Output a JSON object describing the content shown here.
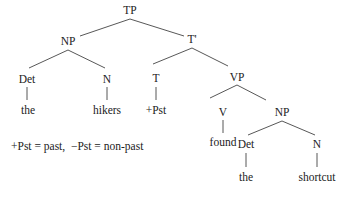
{
  "diagram": {
    "type": "syntax-tree",
    "nodes": {
      "tp": "TP",
      "np_subject": "NP",
      "det_subject": "Det",
      "n_subject": "N",
      "word_the_1": "the",
      "word_hikers": "hikers",
      "t_bar": "T'",
      "t": "T",
      "tense_value": "+Pst",
      "vp": "VP",
      "v": "V",
      "word_found": "found",
      "np_object": "NP",
      "det_object": "Det",
      "n_object": "N",
      "word_the_2": "the",
      "word_shortcut": "shortcut"
    },
    "edges": [
      [
        "TP",
        "NP"
      ],
      [
        "TP",
        "T'"
      ],
      [
        "NP",
        "Det"
      ],
      [
        "NP",
        "N"
      ],
      [
        "Det",
        "the"
      ],
      [
        "N",
        "hikers"
      ],
      [
        "T'",
        "T"
      ],
      [
        "T'",
        "VP"
      ],
      [
        "T",
        "+Pst"
      ],
      [
        "VP",
        "V"
      ],
      [
        "VP",
        "NP"
      ],
      [
        "V",
        "found"
      ],
      [
        "NP",
        "Det"
      ],
      [
        "NP",
        "N"
      ],
      [
        "Det",
        "the"
      ],
      [
        "N",
        "shortcut"
      ]
    ],
    "legend": "+Pst = past,  −Pst = non-past"
  }
}
